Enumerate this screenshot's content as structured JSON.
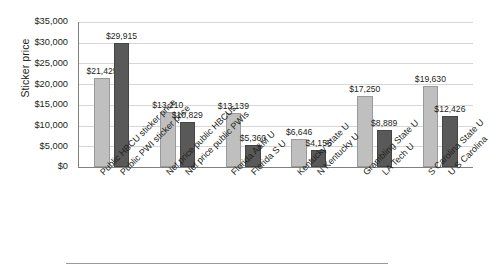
{
  "chart_data": {
    "type": "bar",
    "title": "",
    "xlabel": "",
    "ylabel": "Sticker price",
    "ylim": [
      0,
      35000
    ],
    "ytick_values": [
      0,
      5000,
      10000,
      15000,
      20000,
      25000,
      30000,
      35000
    ],
    "ytick_labels": [
      "$0",
      "$5,000",
      "$10,000",
      "$15,000",
      "$20,000",
      "$25,000",
      "$30,000",
      "$35,000"
    ],
    "grid": true,
    "legend": "none",
    "categories": [
      "Public HBCU sticker price",
      "Public PWI sticker price",
      "Net price public HBCUs",
      "Net price public PWIs",
      "Florida A&M U",
      "Florida S U",
      "Kentucky State U",
      "N Kentucky U",
      "Grambling State U",
      "LA Tech U",
      "S Carolina State U",
      "U S Carolina"
    ],
    "values": [
      21425,
      29915,
      13210,
      10829,
      13139,
      5360,
      6646,
      4156,
      17250,
      8889,
      19630,
      12426
    ],
    "value_labels": [
      "$21,425",
      "$29,915",
      "$13,210",
      "$10,829",
      "$13,139",
      "$5,360",
      "$6,646",
      "$4,156",
      "$17,250",
      "$8,889",
      "$19,630",
      "$12,426"
    ],
    "bar_shades": [
      "light",
      "dark",
      "light",
      "dark",
      "light",
      "dark",
      "light",
      "dark",
      "light",
      "dark",
      "light",
      "dark"
    ],
    "colors": {
      "light_bar": "#bfbfbf",
      "dark_bar": "#595959",
      "gridline": "#d6d6d6",
      "axis": "#808080",
      "text": "#231f20",
      "background": "#ffffff"
    }
  }
}
